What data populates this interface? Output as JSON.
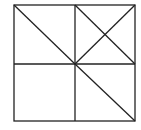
{
  "diagram": {
    "stroke_color": "#222222",
    "background": "#ffffff",
    "square": {
      "x1": 14,
      "y1": 5,
      "x2": 135,
      "y2": 121
    },
    "center": {
      "x": 75,
      "y": 64
    },
    "lines": [
      {
        "id": "vertical-midline",
        "x1": 75,
        "y1": 5,
        "x2": 75,
        "y2": 121
      },
      {
        "id": "horizontal-midline",
        "x1": 14,
        "y1": 64,
        "x2": 135,
        "y2": 64
      },
      {
        "id": "diagonal-top-left-to-center",
        "x1": 14,
        "y1": 5,
        "x2": 75,
        "y2": 64
      },
      {
        "id": "diagonal-top-right-to-center",
        "x1": 135,
        "y1": 5,
        "x2": 75,
        "y2": 64
      },
      {
        "id": "diagonal-top-mid-to-right-mid",
        "x1": 75,
        "y1": 5,
        "x2": 135,
        "y2": 64
      },
      {
        "id": "diagonal-center-to-bottom-right",
        "x1": 75,
        "y1": 64,
        "x2": 135,
        "y2": 121
      }
    ]
  }
}
